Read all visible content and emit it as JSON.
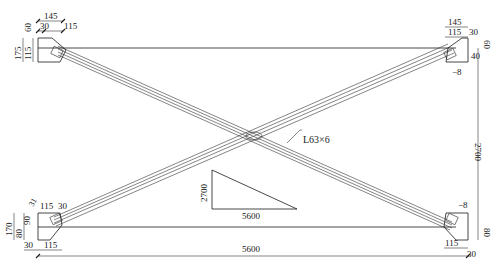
{
  "drawing": {
    "member_label": "L63×6",
    "slope_triangle": {
      "rise": "2700",
      "run": "5600"
    },
    "overall": {
      "width": "5600",
      "height": "2700"
    },
    "top_left_plate": {
      "top_total": "145",
      "top_a": "30",
      "top_b": "115",
      "side_total": "175",
      "side_a": "60",
      "side_b": "115"
    },
    "top_right_plate": {
      "top_total": "145",
      "top_a": "115",
      "top_b": "30",
      "side_a": "60",
      "side_b": "40",
      "weld": "−8"
    },
    "bottom_left_plate": {
      "top_a": "115",
      "top_b": "30",
      "side_total": "170",
      "side_a": "90",
      "side_b": "80",
      "side_c": "31",
      "bottom_a": "30",
      "bottom_b": "115"
    },
    "bottom_right_plate": {
      "bottom_a": "115",
      "bottom_b": "30",
      "side_a": "80",
      "weld": "−8"
    }
  }
}
